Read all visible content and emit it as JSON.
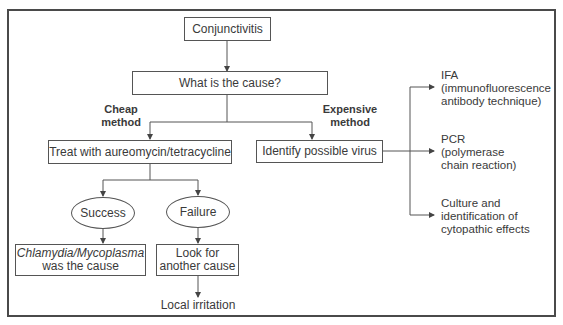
{
  "diagram": {
    "root": "Conjunctivitis",
    "question": "What is the cause?",
    "branches": {
      "cheap": {
        "label_line1": "Cheap",
        "label_line2": "method",
        "action": "Treat with aureomycin/tetracycline",
        "outcomes": {
          "success": {
            "label": "Success",
            "result_italic": "Chlamydia/Mycoplasma",
            "result_rest": "was the cause"
          },
          "failure": {
            "label": "Failure",
            "result_line1": "Look for",
            "result_line2": "another cause",
            "next": "Local irritation"
          }
        }
      },
      "expensive": {
        "label_line1": "Expensive",
        "label_line2": "method",
        "action": "Identify possible virus",
        "methods": [
          {
            "line1": "IFA",
            "line2": "(immunofluorescence",
            "line3": "antibody technique)"
          },
          {
            "line1": "PCR",
            "line2": "(polymerase",
            "line3": "chain reaction)"
          },
          {
            "line1": "Culture and",
            "line2": "identification of",
            "line3": "cytopathic effects"
          }
        ]
      }
    },
    "colors": {
      "line": "#555555",
      "text": "#3a3a3a",
      "frame": "#4a4a4a"
    }
  }
}
